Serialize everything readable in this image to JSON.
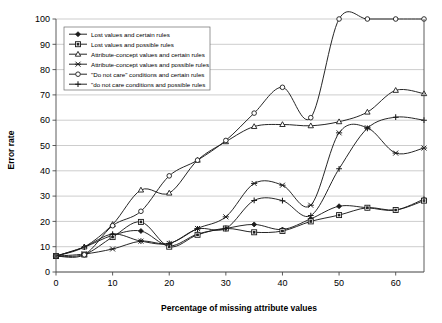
{
  "chart_data": {
    "type": "line",
    "title": "",
    "xlabel": "Percentage of missing attribute values",
    "ylabel": "Error rate",
    "xlim": [
      0,
      65
    ],
    "ylim": [
      0,
      100
    ],
    "xticks": [
      0,
      10,
      20,
      30,
      40,
      50,
      60
    ],
    "yticks": [
      0,
      10,
      20,
      30,
      40,
      50,
      60,
      70,
      80,
      90,
      100
    ],
    "xtick_labels": [
      "0",
      "10",
      "20",
      "30",
      "40",
      "50",
      "60"
    ],
    "ytick_labels": [
      "0",
      "10",
      "20",
      "30",
      "40",
      "50",
      "60",
      "70",
      "80",
      "90",
      "100"
    ],
    "grid": "horizontal",
    "legend_position": "upper-left-inside",
    "x": [
      0,
      5,
      10,
      15,
      20,
      25,
      30,
      35,
      40,
      45,
      50,
      55,
      60,
      65
    ],
    "series": [
      {
        "name": "Lost values and certain rules",
        "marker": "diamond",
        "values": [
          6.3,
          9.8,
          14.5,
          16.2,
          10.3,
          15.0,
          17.2,
          18.8,
          16.8,
          21.0,
          26.0,
          25.4,
          24.5,
          28.8
        ]
      },
      {
        "name": "Lost values and possible rules",
        "marker": "square",
        "values": [
          6.3,
          6.9,
          13.8,
          19.8,
          10.0,
          14.7,
          17.2,
          15.7,
          16.2,
          20.0,
          22.5,
          25.4,
          24.5,
          28.2
        ]
      },
      {
        "name": "Attribute-concept values and certain rules",
        "marker": "triangle",
        "values": [
          6.3,
          9.9,
          18.8,
          32.4,
          31.2,
          44.2,
          51.5,
          57.5,
          58.3,
          57.8,
          59.4,
          63.2,
          71.8,
          70.5
        ]
      },
      {
        "name": "Attribute-concept values and possible rules",
        "marker": "x",
        "values": [
          6.3,
          7.1,
          9.1,
          12.2,
          11.3,
          17.2,
          21.8,
          35.0,
          34.3,
          26.4,
          55.0,
          57.0,
          47.0,
          49.0
        ]
      },
      {
        "name": "\"Do not care\" conditions and certain rules",
        "marker": "circle",
        "values": [
          6.3,
          6.8,
          18.3,
          24.0,
          38.0,
          44.2,
          52.0,
          62.8,
          73.0,
          61.0,
          100.0,
          100.0,
          100.0,
          100.0
        ]
      },
      {
        "name": "\"do not care conditions and possible rules",
        "marker": "plus",
        "values": [
          6.3,
          9.9,
          15.0,
          12.2,
          11.3,
          17.0,
          17.2,
          28.3,
          28.2,
          22.3,
          40.8,
          56.8,
          61.2,
          60.0
        ]
      }
    ],
    "legend_entries": [
      "Lost values and certain rules",
      "Lost values and possible rules",
      "Attribute-concept values and certain rules",
      "Attribute-concept values and possible rules",
      "\"Do not care\" conditions and certain rules",
      "\"do not care conditions and possible rules"
    ],
    "colors": {
      "line": "#1a1a1a",
      "grid": "#b8b8b8",
      "axis": "#4a4a4a",
      "background": "#ffffff"
    }
  }
}
